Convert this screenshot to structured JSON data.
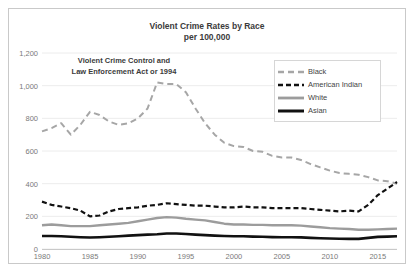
{
  "chart_data": {
    "type": "line",
    "title": "Violent Crime Rates by Race",
    "subtitle": "per 100,000",
    "xlabel": "",
    "ylabel": "",
    "ylim": [
      0,
      1200
    ],
    "ytick_labels": [
      "0",
      "200",
      "400",
      "600",
      "800",
      "1,000",
      "1,200"
    ],
    "ytick_values": [
      0,
      200,
      400,
      600,
      800,
      1000,
      1200
    ],
    "xlim": [
      1980,
      2017
    ],
    "xtick_labels": [
      "1980",
      "1985",
      "1990",
      "1995",
      "2000",
      "2005",
      "2010",
      "2015"
    ],
    "xtick_values": [
      1980,
      1985,
      1990,
      1995,
      2000,
      2005,
      2010,
      2015
    ],
    "grid": "horizontal",
    "legend_position": "top-right",
    "annotation": {
      "line1": "Violent Crime Control  and",
      "line2": "Law Enforcement Act or 1994"
    },
    "x": [
      1980,
      1981,
      1982,
      1983,
      1984,
      1985,
      1986,
      1987,
      1988,
      1989,
      1990,
      1991,
      1992,
      1993,
      1994,
      1995,
      1996,
      1997,
      1998,
      1999,
      2000,
      2001,
      2002,
      2003,
      2004,
      2005,
      2006,
      2007,
      2008,
      2009,
      2010,
      2011,
      2012,
      2013,
      2014,
      2015,
      2016,
      2017
    ],
    "series": [
      {
        "name": "Black",
        "color": "#a6a6a6",
        "style": "dashed",
        "width": 2.0,
        "values": [
          720,
          740,
          770,
          700,
          760,
          840,
          820,
          780,
          760,
          770,
          800,
          860,
          1020,
          1010,
          1010,
          960,
          860,
          770,
          700,
          650,
          630,
          625,
          600,
          595,
          570,
          560,
          560,
          545,
          520,
          500,
          480,
          465,
          460,
          455,
          440,
          420,
          415,
          400
        ]
      },
      {
        "name": "American Indian",
        "color": "#111111",
        "style": "dashed",
        "width": 2.2,
        "values": [
          290,
          270,
          260,
          250,
          235,
          200,
          205,
          230,
          245,
          250,
          255,
          265,
          270,
          280,
          275,
          270,
          265,
          265,
          260,
          255,
          255,
          260,
          255,
          255,
          250,
          250,
          250,
          250,
          245,
          240,
          235,
          230,
          235,
          230,
          270,
          330,
          370,
          410
        ]
      },
      {
        "name": "White",
        "color": "#9c9c9c",
        "style": "solid",
        "width": 2.4,
        "values": [
          145,
          150,
          145,
          140,
          140,
          140,
          145,
          150,
          155,
          160,
          170,
          180,
          190,
          195,
          192,
          185,
          180,
          175,
          165,
          155,
          150,
          150,
          148,
          148,
          145,
          145,
          145,
          143,
          138,
          133,
          128,
          125,
          122,
          118,
          118,
          120,
          122,
          125
        ]
      },
      {
        "name": "Asian",
        "color": "#111111",
        "style": "solid",
        "width": 2.6,
        "values": [
          80,
          80,
          78,
          75,
          72,
          70,
          72,
          75,
          78,
          82,
          85,
          88,
          90,
          95,
          95,
          92,
          88,
          85,
          82,
          80,
          78,
          78,
          76,
          75,
          73,
          72,
          72,
          71,
          68,
          66,
          64,
          63,
          62,
          62,
          68,
          74,
          76,
          78
        ]
      }
    ]
  }
}
